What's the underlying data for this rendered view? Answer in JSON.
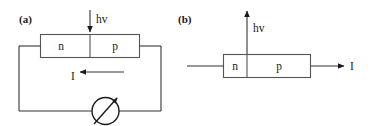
{
  "figure": {
    "background_color": "#ffffff",
    "line_color": "#333333",
    "text_color": "#1a1a1a",
    "width": 371,
    "height": 126
  },
  "panels": [
    {
      "id": "a",
      "label": "(a)",
      "photon_label": "hv",
      "photon_direction": "down-into-device",
      "current_label": "I",
      "current_direction": "leftward",
      "regions": [
        {
          "name": "n-region",
          "label": "n"
        },
        {
          "name": "p-region",
          "label": "p"
        }
      ],
      "meter": {
        "name": "galvanometer",
        "symbol": "circle-with-diagonal-arrow"
      },
      "circuit": "closed-loop"
    },
    {
      "id": "b",
      "label": "(b)",
      "photon_label": "hv",
      "photon_direction": "up-out-of-device",
      "current_label": "I",
      "current_direction": "rightward",
      "regions": [
        {
          "name": "n-region",
          "label": "n"
        },
        {
          "name": "p-region",
          "label": "p"
        }
      ],
      "circuit": "open-leads"
    }
  ]
}
